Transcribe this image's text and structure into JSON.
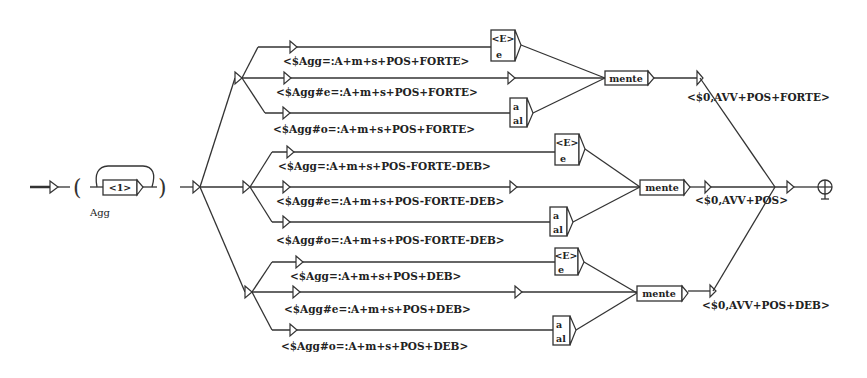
{
  "graph": {
    "initial_state": "initial-arrow",
    "subgraph": {
      "label": "<1>",
      "output_var": "Agg"
    },
    "groups": [
      {
        "id": "forte",
        "branches": [
          {
            "output": "<$Agg=:A+m+s+POS+FORTE>",
            "box_top": "<E>",
            "box_bottom": "e"
          },
          {
            "output": "<$Agg#e=:A+m+s+POS+FORTE>"
          },
          {
            "output": "<$Agg#o=:A+m+s+POS+FORTE>",
            "box_top": "a",
            "box_bottom": "al"
          }
        ],
        "suffix": "mente",
        "final_output": "<$0,AVV+POS+FORTE>"
      },
      {
        "id": "forte-deb",
        "branches": [
          {
            "output": "<$Agg=:A+m+s+POS-FORTE-DEB>",
            "box_top": "<E>",
            "box_bottom": "e"
          },
          {
            "output": "<$Agg#e=:A+m+s+POS-FORTE-DEB>"
          },
          {
            "output": "<$Agg#o=:A+m+s+POS-FORTE-DEB>",
            "box_top": "a",
            "box_bottom": "al"
          }
        ],
        "suffix": "mente",
        "final_output": "<$0,AVV+POS>"
      },
      {
        "id": "deb",
        "branches": [
          {
            "output": "<$Agg=:A+m+s+POS+DEB>",
            "box_top": "<E>",
            "box_bottom": "e"
          },
          {
            "output": "<$Agg#e=:A+m+s+POS+DEB>"
          },
          {
            "output": "<$Agg#o=:A+m+s+POS+DEB>",
            "box_top": "a",
            "box_bottom": "al"
          }
        ],
        "suffix": "mente",
        "final_output": "<$0,AVV+POS+DEB>"
      }
    ],
    "final_state": "final-state-icon"
  },
  "colors": {
    "line": "#333333",
    "background": "#ffffff"
  }
}
